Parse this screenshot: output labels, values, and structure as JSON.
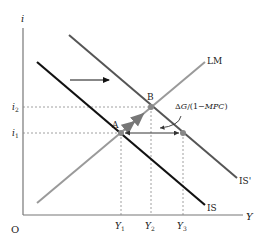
{
  "diagram": {
    "type": "IS-LM fiscal expansion",
    "axes": {
      "y_label": "i",
      "x_label": "Y",
      "origin_label": "O"
    },
    "curves": {
      "lm": {
        "label": "LM",
        "color": "#9a9a9a"
      },
      "is": {
        "label": "IS",
        "color": "#111111"
      },
      "is_prime": {
        "label": "IS'",
        "color": "#555555"
      }
    },
    "points": {
      "a": {
        "label": "A"
      },
      "b": {
        "label": "B"
      }
    },
    "y_ticks": [
      {
        "label": "i",
        "sub": "2"
      },
      {
        "label": "i",
        "sub": "1"
      }
    ],
    "x_ticks": [
      {
        "label": "Y",
        "sub": "1"
      },
      {
        "label": "Y",
        "sub": "2"
      },
      {
        "label": "Y",
        "sub": "3"
      }
    ],
    "annotation": {
      "delta": "Δ",
      "g": "G",
      "slash_open": "/(1−",
      "mpc": "MPC",
      "close": ")"
    }
  }
}
